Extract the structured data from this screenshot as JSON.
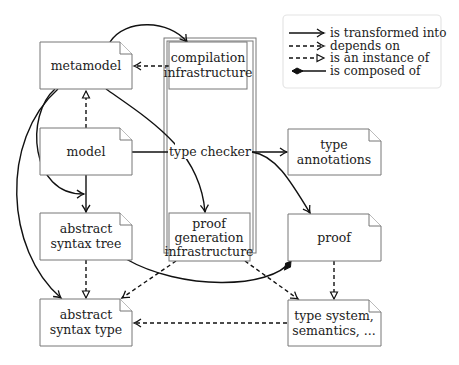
{
  "legend": {
    "items": [
      {
        "style": "solid-arrow",
        "label": "is transformed into"
      },
      {
        "style": "dashed-arrow",
        "label": "depends on"
      },
      {
        "style": "dashed-open-triangle",
        "label": "is an instance of"
      },
      {
        "style": "solid-diamond",
        "label": "is composed of"
      }
    ]
  },
  "nodes": {
    "metamodel": {
      "lines": [
        "metamodel"
      ]
    },
    "compilation_infrastructure": {
      "lines": [
        "compilation",
        "infrastructure"
      ]
    },
    "model": {
      "lines": [
        "model"
      ]
    },
    "type_checker": {
      "lines": [
        "type checker"
      ]
    },
    "type_annotations": {
      "lines": [
        "type",
        "annotations"
      ]
    },
    "abstract_syntax_tree": {
      "lines": [
        "abstract",
        "syntax tree"
      ]
    },
    "proof_generation_infrastructure": {
      "lines": [
        "proof",
        "generation",
        "infrastructure"
      ]
    },
    "proof": {
      "lines": [
        "proof"
      ]
    },
    "abstract_syntax_type": {
      "lines": [
        "abstract",
        "syntax type"
      ]
    },
    "type_system": {
      "lines": [
        "type system,",
        "semantics, ..."
      ]
    }
  },
  "edges": [
    {
      "from": "metamodel",
      "to": "compilation_infrastructure",
      "type": "is transformed into"
    },
    {
      "from": "compilation_infrastructure",
      "to": "metamodel",
      "type": "depends on"
    },
    {
      "from": "model",
      "to": "metamodel",
      "type": "is an instance of"
    },
    {
      "from": "model",
      "to": "type_checker",
      "type": "is transformed into"
    },
    {
      "from": "type_checker",
      "to": "type_annotations",
      "type": "is transformed into"
    },
    {
      "from": "type_checker",
      "to": "proof",
      "type": "is transformed into"
    },
    {
      "from": "metamodel",
      "to": "proof_generation_infrastructure",
      "type": "is transformed into"
    },
    {
      "from": "metamodel",
      "to": "abstract_syntax_tree",
      "type": "is transformed into"
    },
    {
      "from": "metamodel",
      "to": "abstract_syntax_type",
      "type": "is transformed into"
    },
    {
      "from": "model",
      "to": "abstract_syntax_tree",
      "type": "is transformed into"
    },
    {
      "from": "abstract_syntax_tree",
      "to": "abstract_syntax_type",
      "type": "is an instance of"
    },
    {
      "from": "proof",
      "to": "abstract_syntax_tree",
      "type": "is composed of"
    },
    {
      "from": "proof_generation_infrastructure",
      "to": "abstract_syntax_type",
      "type": "depends on"
    },
    {
      "from": "proof_generation_infrastructure",
      "to": "type_system",
      "type": "depends on"
    },
    {
      "from": "proof",
      "to": "type_system",
      "type": "is an instance of"
    },
    {
      "from": "type_system",
      "to": "abstract_syntax_type",
      "type": "depends on"
    }
  ]
}
